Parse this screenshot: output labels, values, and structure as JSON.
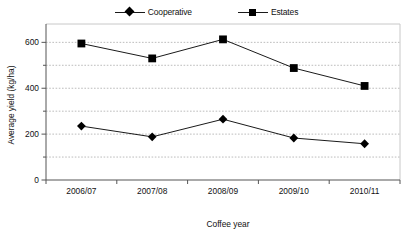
{
  "chart_data": {
    "type": "line",
    "title": "",
    "subtitle": "",
    "xlabel": "Coffee year",
    "ylabel": "Average yield  (kg/ha)",
    "categories": [
      "2006/07",
      "2007/08",
      "2008/09",
      "2009/10",
      "2010/11"
    ],
    "series": [
      {
        "name": "Cooperative",
        "marker": "diamond",
        "color": "#000000",
        "values": [
          235,
          188,
          265,
          183,
          158
        ]
      },
      {
        "name": "Estates",
        "marker": "square",
        "color": "#000000",
        "values": [
          595,
          530,
          613,
          488,
          410
        ]
      }
    ],
    "ylim": [
      0,
      680
    ],
    "yticks": [
      0,
      200,
      400,
      600
    ],
    "ytick_labels": [
      "0",
      "200",
      "400",
      "600"
    ],
    "yminor_ticks": [
      100,
      300,
      500
    ],
    "gridlines": [
      100,
      200,
      300,
      400,
      500,
      600
    ],
    "grid": true,
    "grid_style": "dashed",
    "grid_color": "#b4b4b4",
    "legend_position": "top",
    "axis_color": "#555555",
    "frame_color": "#c8c8c8",
    "background": "#ffffff"
  },
  "legend": {
    "entries": [
      {
        "label": "Cooperative",
        "marker": "diamond"
      },
      {
        "label": "Estates",
        "marker": "square"
      }
    ]
  },
  "axes": {
    "y_title": "Average yield  (kg/ha)",
    "x_title": "Coffee year",
    "y_labels": [
      "600",
      "400",
      "200",
      "0"
    ],
    "x_labels": [
      "2006/07",
      "2007/08",
      "2008/09",
      "2009/10",
      "2010/11"
    ]
  }
}
